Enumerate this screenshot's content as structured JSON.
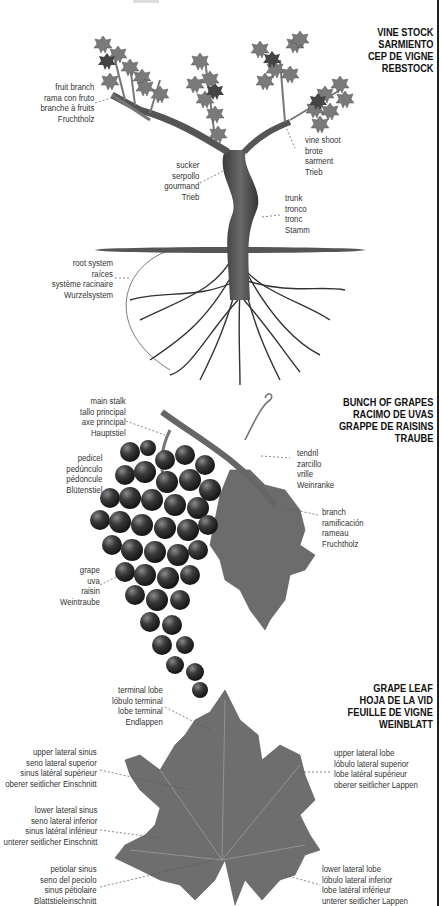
{
  "sections": {
    "vine_stock": {
      "title": [
        "VINE STOCK",
        "SARMIENTO",
        "CEP DE VIGNE",
        "REBSTOCK"
      ],
      "labels": {
        "fruit_branch": [
          "fruit branch",
          "rama con fruto",
          "branche à fruits",
          "Fruchtholz"
        ],
        "vine_shoot": [
          "vine shoot",
          "brote",
          "sarment",
          "Trieb"
        ],
        "sucker": [
          "sucker",
          "serpollo",
          "gourmand",
          "Trieb"
        ],
        "trunk": [
          "trunk",
          "tronco",
          "tronc",
          "Stamm"
        ],
        "root_system": [
          "root system",
          "raíces",
          "système racinaire",
          "Wurzelsystem"
        ]
      }
    },
    "bunch_of_grapes": {
      "title": [
        "BUNCH OF GRAPES",
        "RACIMO DE UVAS",
        "GRAPPE DE RAISINS",
        "TRAUBE"
      ],
      "labels": {
        "main_stalk": [
          "main stalk",
          "tallo principal",
          "axe principal",
          "Hauptstiel"
        ],
        "tendril": [
          "tendril",
          "zarcillo",
          "vrille",
          "Weinranke"
        ],
        "pedicel": [
          "pedicel",
          "pedúnculo",
          "pédoncule",
          "Blütenstiel"
        ],
        "branch": [
          "branch",
          "ramificación",
          "rameau",
          "Fruchtholz"
        ],
        "grape": [
          "grape",
          "uva",
          "raisin",
          "Weintraube"
        ]
      }
    },
    "grape_leaf": {
      "title": [
        "GRAPE LEAF",
        "HOJA DE LA VID",
        "FEUILLE DE VIGNE",
        "WEINBLATT"
      ],
      "labels": {
        "terminal_lobe": [
          "terminal lobe",
          "lóbulo terminal",
          "lobe terminal",
          "Endlappen"
        ],
        "upper_lateral_sinus": [
          "upper lateral sinus",
          "seno lateral superior",
          "sinus latéral supérieur",
          "oberer seitlicher Einschnitt"
        ],
        "upper_lateral_lobe": [
          "upper lateral lobe",
          "lóbulo lateral superior",
          "lobe latéral supérieur",
          "oberer seitlicher Lappen"
        ],
        "lower_lateral_sinus": [
          "lower lateral sinus",
          "seno lateral inferior",
          "sinus latéral inférieur",
          "unterer seitlicher Einschnitt"
        ],
        "petiolar_sinus": [
          "petiolar sinus",
          "seno del peciolo",
          "sinus pétiolaire",
          "Blattstieleinschnitt"
        ],
        "lower_lateral_lobe": [
          "lower lateral lobe",
          "lóbulo lateral inferior",
          "lobe latéral inférieur",
          "unterer seitlicher Lappen"
        ]
      }
    }
  },
  "colors": {
    "leaf": "#6f6f6f",
    "grape": "#2b2b2b",
    "wood": "#4a4a4a",
    "text": "#333333",
    "title": "#111111"
  }
}
